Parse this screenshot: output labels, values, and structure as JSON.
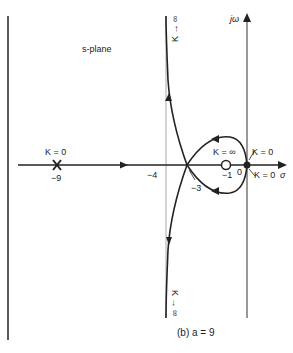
{
  "diagram": {
    "plane_label": "s-plane",
    "axes": {
      "imag": "jω",
      "real": "σ"
    },
    "caption": "(b)  a = 9",
    "poles": [
      {
        "position": -9,
        "marker": "x",
        "label_value": "−9",
        "label_gain": "K = 0"
      },
      {
        "position": 0,
        "marker": "dot",
        "label_value": "0",
        "label_gain_top": "K = 0",
        "label_gain_bottom": "K = 0"
      }
    ],
    "zeros": [
      {
        "position": -1,
        "marker": "o",
        "label_value": "−1",
        "label_gain": "K = ∞"
      }
    ],
    "asymptote": {
      "position": -4,
      "label": "−4",
      "label_top": "K → ∞",
      "label_bottom": "K → ∞"
    },
    "breakaway": {
      "position": -3,
      "label": "−3"
    }
  }
}
